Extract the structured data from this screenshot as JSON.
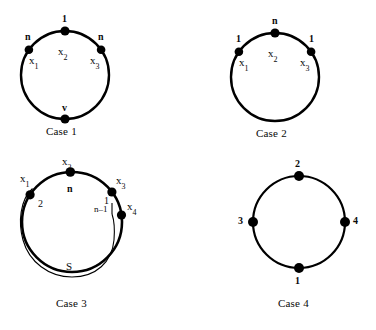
{
  "figure": {
    "title": "",
    "background_color": "#ffffff",
    "stroke_color": "#000000",
    "node_color": "#000000",
    "cases": [
      {
        "id": "case-1",
        "caption": "Case  1",
        "circle": {
          "cx": 65,
          "cy": 75,
          "r": 44
        },
        "nodes": [
          {
            "name": "x1",
            "var_base": "x",
            "var_sub": "1",
            "tag": "n",
            "angle_deg": 215
          },
          {
            "name": "x2",
            "var_base": "x",
            "var_sub": "2",
            "tag": "1",
            "angle_deg": 270
          },
          {
            "name": "x3",
            "var_base": "x",
            "var_sub": "3",
            "tag": "n",
            "angle_deg": 325
          },
          {
            "name": "v",
            "var_base": "",
            "var_sub": "",
            "tag": "v",
            "angle_deg": 90
          }
        ]
      },
      {
        "id": "case-2",
        "caption": "Case  2",
        "circle": {
          "cx": 275,
          "cy": 77,
          "r": 44
        },
        "nodes": [
          {
            "name": "x1",
            "var_base": "x",
            "var_sub": "1",
            "tag": "1",
            "angle_deg": 215
          },
          {
            "name": "x2",
            "var_base": "x",
            "var_sub": "2",
            "tag": "n",
            "angle_deg": 270
          },
          {
            "name": "x3",
            "var_base": "x",
            "var_sub": "3",
            "tag": "1",
            "angle_deg": 325
          }
        ]
      },
      {
        "id": "case-3",
        "caption": "Case 3",
        "circle": {
          "cx": 72,
          "cy": 222,
          "r": 50
        },
        "inner_arc_label": "S",
        "nodes": [
          {
            "name": "x1",
            "var_base": "x",
            "var_sub": "1",
            "tag": "2",
            "angle_deg": 213
          },
          {
            "name": "x2",
            "var_base": "x",
            "var_sub": "2",
            "tag": "n",
            "angle_deg": 268
          },
          {
            "name": "x3",
            "var_base": "x",
            "var_sub": "3",
            "tag": "1",
            "angle_deg": 323
          },
          {
            "name": "x4",
            "var_base": "x",
            "var_sub": "4",
            "tag": "n–1",
            "angle_deg": 352
          }
        ]
      },
      {
        "id": "case-4",
        "caption": "Case  4",
        "circle": {
          "cx": 299,
          "cy": 222,
          "r": 46
        },
        "nodes": [
          {
            "name": "top",
            "var_base": "",
            "var_sub": "",
            "tag": "2",
            "angle_deg": 270
          },
          {
            "name": "left",
            "var_base": "",
            "var_sub": "",
            "tag": "3",
            "angle_deg": 180
          },
          {
            "name": "right",
            "var_base": "",
            "var_sub": "",
            "tag": "4",
            "angle_deg": 0
          },
          {
            "name": "bottom",
            "var_base": "",
            "var_sub": "",
            "tag": "1",
            "angle_deg": 90
          }
        ]
      }
    ]
  }
}
